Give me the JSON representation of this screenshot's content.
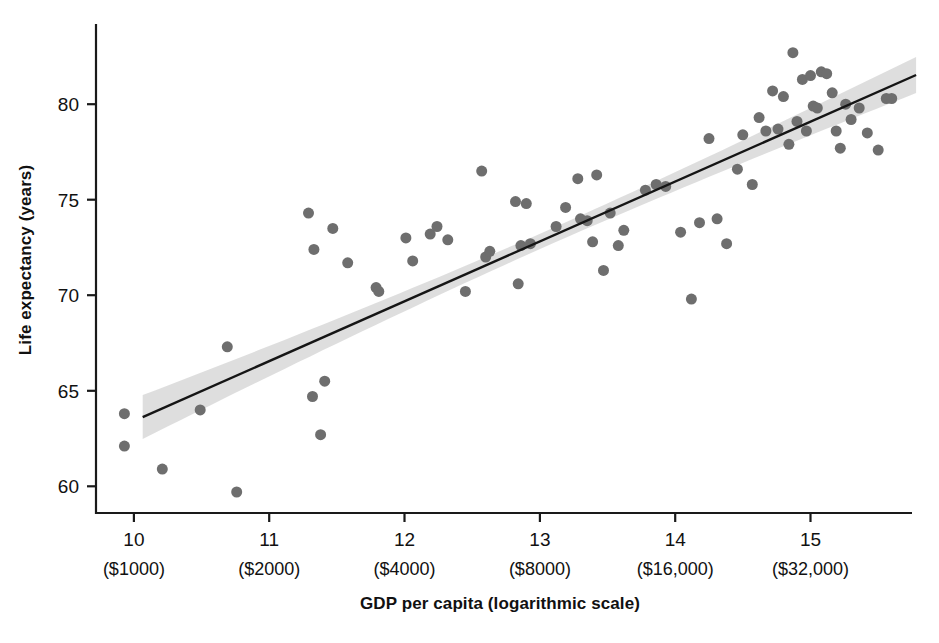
{
  "chart_data": {
    "type": "scatter",
    "title": "",
    "xlabel": "GDP per capita (logarithmic scale)",
    "ylabel": "Life expectancy (years)",
    "xlim": [
      9.72,
      15.75
    ],
    "ylim": [
      58.6,
      84.2
    ],
    "grid": false,
    "legend": null,
    "x_tick_labels": [
      "10",
      "11",
      "12",
      "13",
      "14",
      "15"
    ],
    "x_tick_sublabels": [
      "($1000)",
      "($2000)",
      "($4000)",
      "($8000)",
      "($16,000)",
      "($32,000)"
    ],
    "x_ticks": [
      10,
      11,
      12,
      13,
      14,
      15
    ],
    "y_ticks": [
      60,
      65,
      70,
      75,
      80
    ],
    "y_tick_labels": [
      "60",
      "65",
      "70",
      "75",
      "80"
    ],
    "point_color": "#6e6e6e",
    "line_color": "#151515",
    "band_color": "#dcdcdc",
    "axis_color": "#1a1a1a",
    "marker_size": 11,
    "trend_line": {
      "x_start": 10.065,
      "y_start": 63.62,
      "x_end": 15.78,
      "y_end": 81.53,
      "label": "linear fit"
    },
    "confidence_band": {
      "label": "confidence interval",
      "half_width_start": 1.15,
      "half_width_mid": 0.4,
      "half_width_end": 0.95
    },
    "points": [
      {
        "x": 9.93,
        "y": 62.1
      },
      {
        "x": 9.93,
        "y": 63.8
      },
      {
        "x": 10.21,
        "y": 60.9
      },
      {
        "x": 10.49,
        "y": 64.0
      },
      {
        "x": 10.69,
        "y": 67.3
      },
      {
        "x": 10.76,
        "y": 59.7
      },
      {
        "x": 11.29,
        "y": 74.3
      },
      {
        "x": 11.32,
        "y": 64.7
      },
      {
        "x": 11.33,
        "y": 72.4
      },
      {
        "x": 11.38,
        "y": 62.7
      },
      {
        "x": 11.41,
        "y": 65.5
      },
      {
        "x": 11.47,
        "y": 73.5
      },
      {
        "x": 11.58,
        "y": 71.7
      },
      {
        "x": 11.79,
        "y": 70.4
      },
      {
        "x": 11.81,
        "y": 70.2
      },
      {
        "x": 12.01,
        "y": 73.0
      },
      {
        "x": 12.06,
        "y": 71.8
      },
      {
        "x": 12.19,
        "y": 73.2
      },
      {
        "x": 12.24,
        "y": 73.6
      },
      {
        "x": 12.32,
        "y": 72.9
      },
      {
        "x": 12.45,
        "y": 70.2
      },
      {
        "x": 12.57,
        "y": 76.5
      },
      {
        "x": 12.6,
        "y": 72.0
      },
      {
        "x": 12.63,
        "y": 72.3
      },
      {
        "x": 12.82,
        "y": 74.9
      },
      {
        "x": 12.84,
        "y": 70.6
      },
      {
        "x": 12.86,
        "y": 72.6
      },
      {
        "x": 12.9,
        "y": 74.8
      },
      {
        "x": 12.93,
        "y": 72.7
      },
      {
        "x": 13.12,
        "y": 73.6
      },
      {
        "x": 13.19,
        "y": 74.6
      },
      {
        "x": 13.28,
        "y": 76.1
      },
      {
        "x": 13.3,
        "y": 74.0
      },
      {
        "x": 13.35,
        "y": 73.9
      },
      {
        "x": 13.39,
        "y": 72.8
      },
      {
        "x": 13.42,
        "y": 76.3
      },
      {
        "x": 13.47,
        "y": 71.3
      },
      {
        "x": 13.52,
        "y": 74.3
      },
      {
        "x": 13.58,
        "y": 72.6
      },
      {
        "x": 13.62,
        "y": 73.4
      },
      {
        "x": 13.78,
        "y": 75.5
      },
      {
        "x": 13.86,
        "y": 75.8
      },
      {
        "x": 13.93,
        "y": 75.7
      },
      {
        "x": 14.04,
        "y": 73.3
      },
      {
        "x": 14.12,
        "y": 69.8
      },
      {
        "x": 14.18,
        "y": 73.8
      },
      {
        "x": 14.25,
        "y": 78.2
      },
      {
        "x": 14.31,
        "y": 74.0
      },
      {
        "x": 14.38,
        "y": 72.7
      },
      {
        "x": 14.46,
        "y": 76.6
      },
      {
        "x": 14.5,
        "y": 78.4
      },
      {
        "x": 14.57,
        "y": 75.8
      },
      {
        "x": 14.62,
        "y": 79.3
      },
      {
        "x": 14.67,
        "y": 78.6
      },
      {
        "x": 14.72,
        "y": 80.7
      },
      {
        "x": 14.76,
        "y": 78.7
      },
      {
        "x": 14.8,
        "y": 80.4
      },
      {
        "x": 14.84,
        "y": 77.9
      },
      {
        "x": 14.87,
        "y": 82.7
      },
      {
        "x": 14.9,
        "y": 79.1
      },
      {
        "x": 14.94,
        "y": 81.3
      },
      {
        "x": 14.97,
        "y": 78.6
      },
      {
        "x": 15.0,
        "y": 81.5
      },
      {
        "x": 15.02,
        "y": 79.9
      },
      {
        "x": 15.05,
        "y": 79.8
      },
      {
        "x": 15.08,
        "y": 81.7
      },
      {
        "x": 15.12,
        "y": 81.6
      },
      {
        "x": 15.16,
        "y": 80.6
      },
      {
        "x": 15.19,
        "y": 78.6
      },
      {
        "x": 15.22,
        "y": 77.7
      },
      {
        "x": 15.26,
        "y": 80.0
      },
      {
        "x": 15.3,
        "y": 79.2
      },
      {
        "x": 15.36,
        "y": 79.8
      },
      {
        "x": 15.42,
        "y": 78.5
      },
      {
        "x": 15.5,
        "y": 77.6
      },
      {
        "x": 15.56,
        "y": 80.3
      },
      {
        "x": 15.6,
        "y": 80.3
      }
    ]
  }
}
